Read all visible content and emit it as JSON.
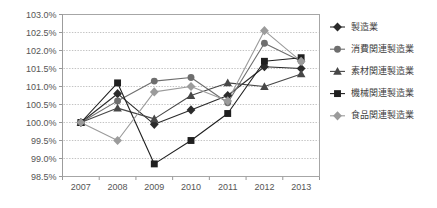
{
  "chart_data": {
    "type": "line",
    "title": "",
    "subtitle": "",
    "xlabel": "",
    "ylabel": "",
    "categories": [
      "2007",
      "2008",
      "2009",
      "2010",
      "2011",
      "2012",
      "2013"
    ],
    "x_tick_labels": [
      "2007",
      "2008",
      "2009",
      "2010",
      "2011",
      "2012",
      "2013"
    ],
    "y_tick_labels": [
      "98.5%",
      "99.0%",
      "99.5%",
      "100.0%",
      "100.5%",
      "101.0%",
      "101.5%",
      "102.0%",
      "102.5%",
      "103.0%"
    ],
    "y_tick_values": [
      98.5,
      99.0,
      99.5,
      100.0,
      100.5,
      101.0,
      101.5,
      102.0,
      102.5,
      103.0
    ],
    "ylim": [
      98.5,
      103.0
    ],
    "y_tick_step": 0.5,
    "grid": true,
    "grid_axis": "y",
    "legend_position": "right",
    "series": [
      {
        "name": "製造業",
        "marker": "diamond",
        "color": "#2b2b2b",
        "values": [
          100.0,
          100.8,
          99.95,
          100.35,
          100.75,
          101.55,
          101.5
        ]
      },
      {
        "name": "消費関連製造業",
        "marker": "circle",
        "color": "#6e6e6e",
        "values": [
          100.0,
          100.6,
          101.15,
          101.25,
          100.55,
          102.2,
          101.7
        ]
      },
      {
        "name": "素材関連製造業",
        "marker": "triangle",
        "color": "#474747",
        "values": [
          100.0,
          100.4,
          100.1,
          100.75,
          101.1,
          101.0,
          101.35
        ]
      },
      {
        "name": "機械関連製造業",
        "marker": "square",
        "color": "#1f1f1f",
        "values": [
          100.0,
          101.1,
          98.85,
          99.5,
          100.25,
          101.7,
          101.8
        ]
      },
      {
        "name": "食品関連製造業",
        "marker": "diamond",
        "color": "#9b9b9b",
        "values": [
          100.0,
          99.5,
          100.85,
          101.0,
          100.6,
          102.55,
          101.7
        ]
      }
    ]
  },
  "legend": {
    "items": [
      {
        "label": "製造業"
      },
      {
        "label": "消費関連製造業"
      },
      {
        "label": "素材関連製造業"
      },
      {
        "label": "機械関連製造業"
      },
      {
        "label": "食品関連製造業"
      }
    ]
  }
}
